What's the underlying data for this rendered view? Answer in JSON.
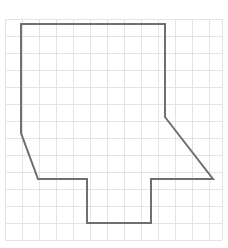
{
  "figure": {
    "title": "",
    "background_color": "#ffffff",
    "width": 228,
    "height": 248,
    "grid": {
      "name": "square-grid",
      "visible": true,
      "line_color": "#e3e3e3",
      "line_width": 1,
      "cell_size": 17,
      "origin_x": 5,
      "origin_y": 19,
      "columns": 13,
      "rows": 13,
      "x_lines": [
        5,
        22,
        39,
        56,
        73,
        90,
        107,
        124,
        141,
        158,
        175,
        192,
        209,
        222
      ],
      "y_lines": [
        19,
        36,
        53,
        70,
        87,
        104,
        121,
        138,
        155,
        172,
        189,
        206,
        223,
        240
      ]
    },
    "shape": {
      "name": "irregular-polygon",
      "type": "closed-polygon",
      "stroke_color": "#6f6f6f",
      "stroke_width": 2,
      "fill": "none",
      "vertex_count": 10,
      "vertices": [
        [
          21,
          24
        ],
        [
          165,
          24
        ],
        [
          165,
          117
        ],
        [
          213,
          179
        ],
        [
          151,
          179
        ],
        [
          151,
          223
        ],
        [
          87,
          223
        ],
        [
          87,
          179
        ],
        [
          38,
          179
        ],
        [
          21,
          133
        ]
      ],
      "points_string": "21,24 165,24 165,117 213,179 151,179 151,223 87,223 87,179 38,179 21,133"
    }
  }
}
